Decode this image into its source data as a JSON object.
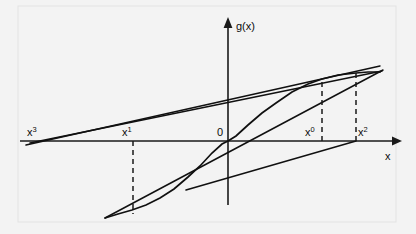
{
  "figure": {
    "kind": "secant-method-diagram",
    "background_color": "#f3f3f3",
    "ink_color": "#101010",
    "width": 416,
    "height": 234
  },
  "axes": {
    "y_axis_label": "g(x)",
    "x_axis_label": "x",
    "origin_label": "0",
    "x_axis_y_px": 141,
    "y_axis_x_px": 228,
    "x_axis_left_px": 20,
    "x_axis_right_px": 398,
    "y_axis_top_px": 22,
    "y_axis_bottom_px": 205
  },
  "points": [
    {
      "id": "x3",
      "base": "x",
      "exponent": "3",
      "x_px": 38,
      "label_x_px": 27,
      "label_y_px": 136,
      "has_dashed_drop": false
    },
    {
      "id": "x1",
      "base": "x",
      "exponent": "1",
      "x_px": 133,
      "label_x_px": 122,
      "label_y_px": 136,
      "has_dashed_drop": true,
      "drop_to_y_px": 214
    },
    {
      "id": "x0",
      "base": "x",
      "exponent": "0",
      "x_px": 322,
      "label_x_px": 305,
      "label_y_px": 136,
      "has_dashed_drop": true,
      "drop_to_y_px": 82
    },
    {
      "id": "x2",
      "base": "x",
      "exponent": "2",
      "x_px": 356,
      "label_x_px": 358,
      "label_y_px": 136,
      "has_dashed_drop": true,
      "drop_to_y_px": 73
    }
  ],
  "chart_data": {
    "type": "line",
    "title": "",
    "xlabel": "x",
    "ylabel": "g(x)",
    "grid": false,
    "legend": null,
    "series": [
      {
        "name": "g(x)",
        "kind": "curve",
        "points_px": [
          [
            105,
            218
          ],
          [
            118,
            214
          ],
          [
            132,
            210
          ],
          [
            146,
            205
          ],
          [
            160,
            198
          ],
          [
            174,
            189
          ],
          [
            188,
            177
          ],
          [
            200,
            166
          ],
          [
            212,
            153
          ],
          [
            222,
            144
          ],
          [
            228,
            141
          ],
          [
            236,
            136
          ],
          [
            248,
            125
          ],
          [
            262,
            113
          ],
          [
            276,
            103
          ],
          [
            292,
            92
          ],
          [
            308,
            84
          ],
          [
            322,
            79
          ],
          [
            338,
            75
          ],
          [
            356,
            73
          ],
          [
            368,
            72
          ],
          [
            380,
            72
          ]
        ]
      },
      {
        "name": "secant-x1-x2",
        "kind": "chord",
        "from_px": [
          105,
          218
        ],
        "to_px": [
          383,
          70
        ],
        "crosses_axis_at_px": 238
      },
      {
        "name": "secant-x3-upper",
        "kind": "chord",
        "from_px": [
          30,
          143
        ],
        "to_px": [
          382,
          71
        ],
        "crosses_axis_at_px": 38
      },
      {
        "name": "secant-x1-upper",
        "kind": "chord",
        "from_px": [
          26,
          145
        ],
        "to_px": [
          380,
          66
        ],
        "crosses_axis_at_px": 33
      },
      {
        "name": "secant-lower-right",
        "kind": "chord",
        "from_px": [
          186,
          190
        ],
        "to_px": [
          356,
          141
        ]
      }
    ]
  }
}
